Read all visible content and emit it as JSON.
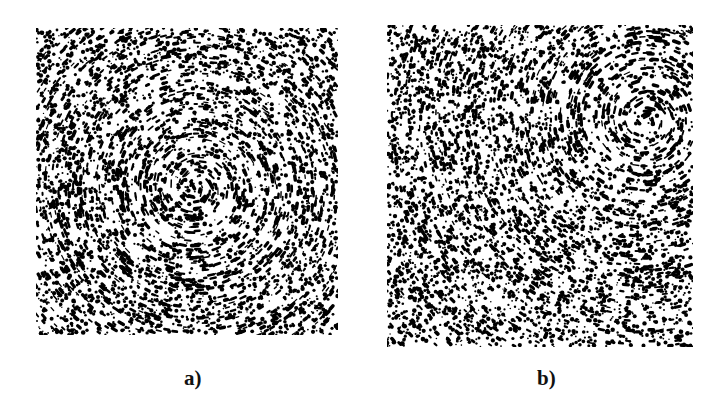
{
  "figure": {
    "panels": [
      {
        "id": "a",
        "label": "a)",
        "box": {
          "x": 36,
          "y": 28,
          "w": 302,
          "h": 307
        },
        "vortex": {
          "cx": 160,
          "cy": 160,
          "strength": 1.0,
          "direction": "counterclockwise"
        },
        "label_pos": {
          "x": 184,
          "y": 366
        }
      },
      {
        "id": "b",
        "label": "b)",
        "box": {
          "x": 387,
          "y": 25,
          "w": 306,
          "h": 322
        },
        "vortex": {
          "cx": 258,
          "cy": 95,
          "strength": 1.0,
          "direction": "counterclockwise"
        },
        "label_pos": {
          "x": 537,
          "y": 366
        }
      }
    ],
    "particle_color": "#000000",
    "background_color": "#ffffff"
  }
}
